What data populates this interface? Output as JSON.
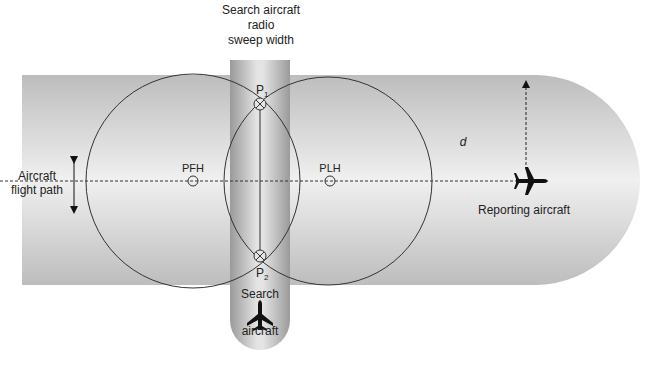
{
  "diagram": {
    "title_search_width": [
      "Search aircraft",
      "radio",
      "sweep width"
    ],
    "flight_path_label": [
      "Aircraft",
      "flight path"
    ],
    "pfh_label": "PFH",
    "plh_label": "PLH",
    "p1_label": "P",
    "p1_sub": "1",
    "p2_label": "P",
    "p2_sub": "2",
    "distance_label": "d",
    "reporting_aircraft_label": "Reporting aircraft",
    "search_aircraft_label": [
      "Search",
      "aircraft"
    ],
    "icons": {
      "reporting_aircraft": "airplane-icon",
      "search_aircraft": "airplane-icon"
    },
    "colors": {
      "band_light": "#efefef",
      "band_dark": "#b8b8b8",
      "line": "#333333"
    }
  }
}
